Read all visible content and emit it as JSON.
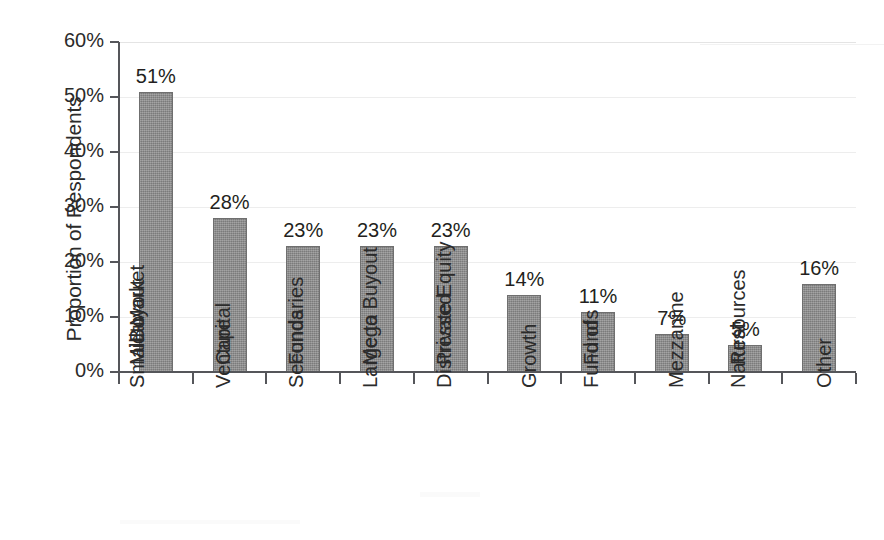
{
  "chart_data": {
    "type": "bar",
    "title": "",
    "subtitle": "",
    "xlabel": "",
    "ylabel": "Proportion of Respondents",
    "ylim": [
      0,
      60
    ],
    "yunit": "%",
    "grid": true,
    "legend": "none",
    "orientation": "vertical",
    "bar_color": "#8a8a8a",
    "categories": [
      "Small to Mid-Market Buyout",
      "Venture Capital",
      "Secondaries Funds",
      "Large to Mega Buyout",
      "Distressed Private Equity",
      "Growth",
      "Fund of Funds",
      "Mezzanine",
      "Natural Resources",
      "Other"
    ],
    "category_lines": [
      [
        "Small to",
        "Mid-Market",
        "Buyout"
      ],
      [
        "Venture",
        "Capital"
      ],
      [
        "Secondaries",
        "Funds"
      ],
      [
        "Large to",
        "Mega Buyout"
      ],
      [
        "Distressed",
        "Private Equity"
      ],
      [
        "Growth"
      ],
      [
        "Fund of",
        "Funds"
      ],
      [
        "Mezzanine"
      ],
      [
        "Natural",
        "Resources"
      ],
      [
        "Other"
      ]
    ],
    "values": [
      51,
      28,
      23,
      23,
      23,
      14,
      11,
      7,
      5,
      16
    ],
    "value_labels": [
      "51%",
      "28%",
      "23%",
      "23%",
      "23%",
      "14%",
      "11%",
      "7%",
      "5%",
      "16%"
    ],
    "yticks": [
      0,
      10,
      20,
      30,
      40,
      50,
      60
    ],
    "ytick_labels": [
      "0%",
      "10%",
      "20%",
      "30%",
      "40%",
      "50%",
      "60%"
    ]
  }
}
